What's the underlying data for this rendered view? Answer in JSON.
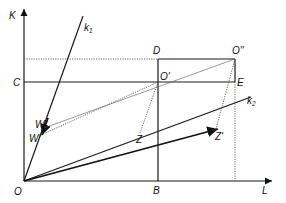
{
  "diagram": {
    "type": "Edgeworth box / factor allocation diagram",
    "axes": {
      "vertical_label": "K",
      "horizontal_label": "L"
    },
    "points": {
      "origin": "O",
      "C": "C",
      "D": "D",
      "O_double_prime": "O''",
      "O_prime": "O'",
      "E": "E",
      "B": "B",
      "W": "W",
      "W_prime": "W'",
      "Z": "Z",
      "Z_prime": "Z'"
    },
    "rays": {
      "k1": {
        "label": "k",
        "subscript": "1"
      },
      "k2": {
        "label": "k",
        "subscript": "2"
      }
    }
  }
}
